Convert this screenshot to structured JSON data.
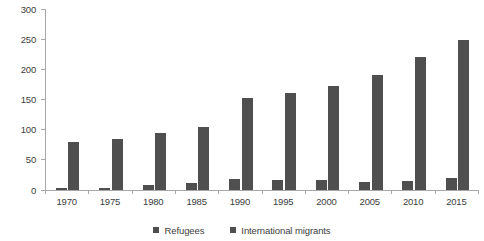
{
  "chart_data": {
    "type": "bar",
    "title": "",
    "subtitle": "",
    "xlabel": "",
    "ylabel": "Number (millions)",
    "categories": [
      "1970",
      "1975",
      "1980",
      "1985",
      "1990",
      "1995",
      "2000",
      "2005",
      "2010",
      "2015"
    ],
    "series": [
      {
        "name": "Refugees",
        "color": "#4f4f4f",
        "values": [
          3,
          3,
          9,
          12,
          19,
          17,
          16,
          13,
          15,
          20
        ]
      },
      {
        "name": "International migrants",
        "color": "#4f4f4f",
        "values": [
          80,
          84,
          94,
          105,
          153,
          160,
          173,
          191,
          221,
          248
        ]
      }
    ],
    "ylim": [
      0,
      300
    ],
    "yticks": [
      0,
      50,
      100,
      150,
      200,
      250,
      300
    ],
    "ytick_labels": [
      "0",
      "50",
      "100",
      "150",
      "200",
      "250",
      "300"
    ],
    "grid": false,
    "legend_position": "bottom",
    "axis_color": "#a8a8a8",
    "text_color": "#3d3d3d",
    "background": "#ffffff"
  },
  "legend": {
    "items": [
      {
        "label": "Refugees"
      },
      {
        "label": "International migrants"
      }
    ]
  }
}
